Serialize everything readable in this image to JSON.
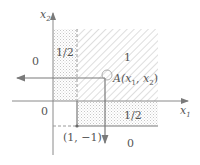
{
  "diagram": {
    "axes": {
      "x_label": "x",
      "x_label_sub": "1",
      "y_label": "x",
      "y_label_sub": "2",
      "origin_label": "0"
    },
    "regions": [
      {
        "name": "left-zero",
        "value": "0"
      },
      {
        "name": "left-strip-half",
        "value": "1/2"
      },
      {
        "name": "upper-right-one",
        "value": "1"
      },
      {
        "name": "lower-strip-half",
        "value": "1/2"
      },
      {
        "name": "bottom-zero",
        "value": "0"
      }
    ],
    "point_a": {
      "prefix": "A(",
      "x": "x",
      "x_sub": "1",
      "sep": ", ",
      "y": "x",
      "y_sub": "2",
      "suffix": ")"
    },
    "point_corner": {
      "label": "(1, −1)"
    },
    "colors": {
      "line": "#7a7a7a",
      "hatch": "#b8b8b8",
      "dots": "#c8c8c8",
      "text": "#555555"
    }
  }
}
